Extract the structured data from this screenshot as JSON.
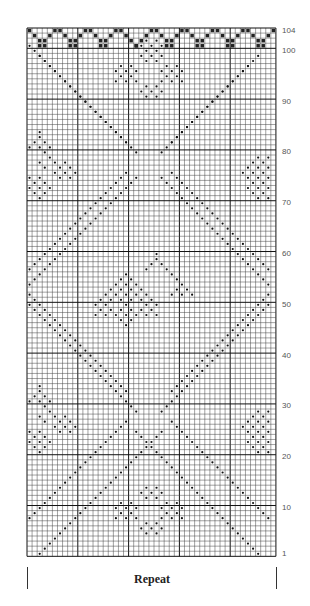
{
  "chart": {
    "columns": 49,
    "rows": 104,
    "grid": {
      "left": 27,
      "top": 28,
      "cell_w": 5.08,
      "cell_h": 5.08,
      "heavy_every": 10
    },
    "colors": {
      "grid_line": "#444444",
      "heavy_line": "#111111",
      "dot": "#111111",
      "edge_fill": "#222222",
      "background": "#ffffff"
    },
    "row_labels": [
      {
        "text": "104",
        "row": 104
      },
      {
        "text": "100",
        "row": 100
      },
      {
        "text": "90",
        "row": 90
      },
      {
        "text": "80",
        "row": 80
      },
      {
        "text": "70",
        "row": 70
      },
      {
        "text": "60",
        "row": 60
      },
      {
        "text": "50",
        "row": 50
      },
      {
        "text": "40",
        "row": 40
      },
      {
        "text": "30",
        "row": 30
      },
      {
        "text": "20",
        "row": 20
      },
      {
        "text": "10",
        "row": 10
      },
      {
        "text": "1",
        "row": 1
      }
    ],
    "diagonals": [
      {
        "from": [
          3,
          1
        ],
        "to": [
          27,
          25
        ]
      },
      {
        "from": [
          1,
          8
        ],
        "to": [
          20,
          27
        ]
      },
      {
        "from": [
          46,
          1
        ],
        "to": [
          22,
          25
        ]
      },
      {
        "from": [
          48,
          8
        ],
        "to": [
          29,
          27
        ]
      },
      {
        "from": [
          27,
          29
        ],
        "to": [
          48,
          50
        ]
      },
      {
        "from": [
          22,
          29
        ],
        "to": [
          1,
          50
        ]
      },
      {
        "from": [
          20,
          33
        ],
        "to": [
          1,
          52
        ]
      },
      {
        "from": [
          29,
          33
        ],
        "to": [
          48,
          52
        ]
      },
      {
        "from": [
          1,
          54
        ],
        "to": [
          22,
          75
        ]
      },
      {
        "from": [
          48,
          54
        ],
        "to": [
          27,
          75
        ]
      },
      {
        "from": [
          1,
          57
        ],
        "to": [
          20,
          76
        ]
      },
      {
        "from": [
          48,
          57
        ],
        "to": [
          29,
          76
        ]
      },
      {
        "from": [
          22,
          80
        ],
        "to": [
          3,
          99
        ]
      },
      {
        "from": [
          27,
          80
        ],
        "to": [
          46,
          99
        ]
      },
      {
        "from": [
          20,
          82
        ],
        "to": [
          1,
          101
        ]
      },
      {
        "from": [
          29,
          82
        ],
        "to": [
          48,
          97
        ]
      }
    ],
    "motifs": [
      {
        "name": "center-motif",
        "cells": [
          [
            26,
            60
          ],
          [
            26,
            59
          ],
          [
            25,
            58
          ],
          [
            27,
            58
          ],
          [
            24,
            57
          ],
          [
            28,
            57
          ],
          [
            29,
            56
          ],
          [
            30,
            55
          ],
          [
            31,
            54
          ],
          [
            30,
            53
          ],
          [
            32,
            53
          ],
          [
            29,
            52
          ],
          [
            31,
            52
          ],
          [
            33,
            52
          ],
          [
            20,
            56
          ],
          [
            19,
            55
          ],
          [
            21,
            55
          ],
          [
            18,
            54
          ],
          [
            20,
            54
          ],
          [
            22,
            54
          ],
          [
            17,
            53
          ],
          [
            19,
            53
          ],
          [
            21,
            53
          ],
          [
            23,
            53
          ],
          [
            16,
            52
          ],
          [
            18,
            52
          ],
          [
            20,
            52
          ],
          [
            22,
            52
          ],
          [
            24,
            52
          ],
          [
            15,
            51
          ],
          [
            17,
            51
          ],
          [
            19,
            51
          ],
          [
            21,
            51
          ],
          [
            23,
            51
          ],
          [
            25,
            51
          ],
          [
            14,
            50
          ],
          [
            16,
            50
          ],
          [
            20,
            50
          ],
          [
            24,
            50
          ],
          [
            26,
            50
          ],
          [
            15,
            49
          ],
          [
            17,
            49
          ],
          [
            19,
            49
          ],
          [
            21,
            49
          ],
          [
            23,
            49
          ],
          [
            25,
            49
          ],
          [
            18,
            48
          ],
          [
            20,
            48
          ],
          [
            22,
            48
          ],
          [
            19,
            47
          ],
          [
            21,
            47
          ],
          [
            20,
            46
          ],
          [
            14,
            48
          ],
          [
            16,
            48
          ],
          [
            24,
            48
          ],
          [
            26,
            48
          ]
        ]
      },
      {
        "name": "top-motif",
        "cells": [
          [
            24,
            102
          ],
          [
            26,
            102
          ],
          [
            23,
            101
          ],
          [
            25,
            101
          ],
          [
            27,
            101
          ],
          [
            24,
            100
          ],
          [
            26,
            100
          ],
          [
            23,
            99
          ],
          [
            25,
            99
          ],
          [
            27,
            99
          ],
          [
            24,
            98
          ],
          [
            26,
            98
          ],
          [
            19,
            97
          ],
          [
            21,
            97
          ],
          [
            28,
            97
          ],
          [
            30,
            97
          ],
          [
            18,
            96
          ],
          [
            20,
            96
          ],
          [
            22,
            96
          ],
          [
            27,
            96
          ],
          [
            29,
            96
          ],
          [
            31,
            96
          ],
          [
            19,
            95
          ],
          [
            21,
            95
          ],
          [
            28,
            95
          ],
          [
            30,
            95
          ],
          [
            18,
            94
          ],
          [
            20,
            94
          ],
          [
            22,
            94
          ],
          [
            27,
            94
          ],
          [
            29,
            94
          ],
          [
            31,
            94
          ],
          [
            24,
            93
          ],
          [
            26,
            93
          ],
          [
            23,
            92
          ],
          [
            25,
            92
          ],
          [
            27,
            92
          ],
          [
            24,
            91
          ],
          [
            26,
            91
          ]
        ]
      },
      {
        "name": "bottom-motif",
        "cells": [
          [
            24,
            14
          ],
          [
            26,
            14
          ],
          [
            23,
            13
          ],
          [
            25,
            13
          ],
          [
            27,
            13
          ],
          [
            24,
            12
          ],
          [
            26,
            12
          ],
          [
            19,
            11
          ],
          [
            21,
            11
          ],
          [
            28,
            11
          ],
          [
            30,
            11
          ],
          [
            18,
            10
          ],
          [
            20,
            10
          ],
          [
            22,
            10
          ],
          [
            27,
            10
          ],
          [
            29,
            10
          ],
          [
            31,
            10
          ],
          [
            19,
            9
          ],
          [
            21,
            9
          ],
          [
            28,
            9
          ],
          [
            30,
            9
          ],
          [
            18,
            8
          ],
          [
            20,
            8
          ],
          [
            22,
            8
          ],
          [
            27,
            8
          ],
          [
            29,
            8
          ],
          [
            31,
            8
          ],
          [
            24,
            7
          ],
          [
            26,
            7
          ],
          [
            23,
            6
          ],
          [
            25,
            6
          ],
          [
            27,
            6
          ],
          [
            24,
            5
          ],
          [
            26,
            5
          ]
        ]
      },
      {
        "name": "left-motif-upper",
        "cells": [
          [
            3,
            84
          ],
          [
            3,
            83
          ],
          [
            2,
            82
          ],
          [
            4,
            82
          ],
          [
            1,
            81
          ],
          [
            3,
            81
          ],
          [
            5,
            81
          ],
          [
            4,
            80
          ],
          [
            5,
            79
          ],
          [
            3,
            78
          ],
          [
            6,
            78
          ],
          [
            8,
            78
          ],
          [
            4,
            77
          ],
          [
            7,
            77
          ],
          [
            9,
            77
          ],
          [
            6,
            76
          ],
          [
            8,
            76
          ],
          [
            10,
            76
          ],
          [
            1,
            75
          ],
          [
            3,
            75
          ],
          [
            7,
            75
          ],
          [
            9,
            75
          ],
          [
            2,
            74
          ],
          [
            4,
            74
          ],
          [
            1,
            73
          ],
          [
            3,
            73
          ],
          [
            5,
            73
          ],
          [
            2,
            72
          ],
          [
            4,
            72
          ],
          [
            3,
            71
          ]
        ]
      },
      {
        "name": "right-motif-upper",
        "cells": [
          [
            46,
            79
          ],
          [
            48,
            79
          ],
          [
            45,
            78
          ],
          [
            47,
            78
          ],
          [
            44,
            77
          ],
          [
            46,
            77
          ],
          [
            48,
            77
          ],
          [
            43,
            76
          ],
          [
            45,
            76
          ],
          [
            47,
            76
          ],
          [
            44,
            75
          ],
          [
            46,
            75
          ],
          [
            48,
            75
          ],
          [
            45,
            74
          ],
          [
            47,
            74
          ],
          [
            44,
            73
          ],
          [
            46,
            73
          ],
          [
            48,
            73
          ],
          [
            45,
            72
          ],
          [
            47,
            72
          ],
          [
            46,
            71
          ],
          [
            48,
            71
          ]
        ]
      },
      {
        "name": "left-motif-lower",
        "cells": [
          [
            3,
            34
          ],
          [
            3,
            33
          ],
          [
            2,
            32
          ],
          [
            4,
            32
          ],
          [
            1,
            31
          ],
          [
            3,
            31
          ],
          [
            5,
            31
          ],
          [
            4,
            30
          ],
          [
            5,
            29
          ],
          [
            3,
            28
          ],
          [
            6,
            28
          ],
          [
            8,
            28
          ],
          [
            4,
            27
          ],
          [
            7,
            27
          ],
          [
            9,
            27
          ],
          [
            6,
            26
          ],
          [
            8,
            26
          ],
          [
            10,
            26
          ],
          [
            1,
            25
          ],
          [
            3,
            25
          ],
          [
            7,
            25
          ],
          [
            9,
            25
          ],
          [
            2,
            24
          ],
          [
            4,
            24
          ],
          [
            1,
            23
          ],
          [
            3,
            23
          ],
          [
            5,
            23
          ],
          [
            2,
            22
          ],
          [
            4,
            22
          ],
          [
            3,
            21
          ]
        ]
      },
      {
        "name": "right-motif-lower",
        "cells": [
          [
            46,
            29
          ],
          [
            48,
            29
          ],
          [
            45,
            28
          ],
          [
            47,
            28
          ],
          [
            44,
            27
          ],
          [
            46,
            27
          ],
          [
            48,
            27
          ],
          [
            43,
            26
          ],
          [
            45,
            26
          ],
          [
            47,
            26
          ],
          [
            44,
            25
          ],
          [
            46,
            25
          ],
          [
            48,
            25
          ],
          [
            45,
            24
          ],
          [
            47,
            24
          ],
          [
            44,
            23
          ],
          [
            46,
            23
          ],
          [
            48,
            23
          ],
          [
            45,
            22
          ],
          [
            47,
            22
          ],
          [
            46,
            21
          ],
          [
            48,
            21
          ]
        ]
      }
    ],
    "edge": {
      "teeth": 8,
      "tooth_width": 6,
      "tooth_height": 4
    }
  },
  "footer": {
    "repeat_label": "Repeat"
  }
}
